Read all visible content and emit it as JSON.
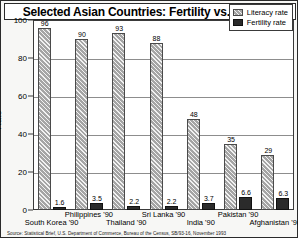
{
  "chart_data": {
    "type": "bar",
    "title": "Selected Asian Countries: Fertility vs. Literacy",
    "xlabel": "",
    "ylabel": "Rate",
    "ylim": [
      0,
      100
    ],
    "yticks": [
      0,
      20,
      40,
      60,
      80,
      100
    ],
    "grid": true,
    "legend_position": "top-right",
    "categories": [
      "South Korea '90",
      "Philippines '90",
      "Thailand '90",
      "Sri Lanka '90",
      "India '90",
      "Pakistan '90",
      "Afghanistan '90"
    ],
    "series": [
      {
        "name": "Literacy rate",
        "values": [
          96,
          90,
          93,
          88,
          48,
          35,
          29
        ]
      },
      {
        "name": "Fertility rate",
        "values": [
          1.6,
          3.5,
          2.2,
          2.2,
          3.7,
          6.6,
          6.3
        ]
      }
    ]
  },
  "legend": {
    "items": [
      {
        "label": "Literacy rate"
      },
      {
        "label": "Fertility rate"
      }
    ]
  },
  "source": {
    "text": "Source: Statistical Brief, U.S. Department of Commerce, Bureau of the Census, SB/93-16, November 1993"
  }
}
